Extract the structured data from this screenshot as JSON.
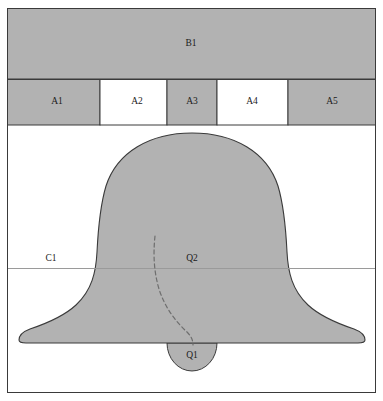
{
  "figure": {
    "title": "",
    "width": 383,
    "height": 401,
    "background_color": "#ffffff",
    "frame": {
      "x": 7,
      "y": 8,
      "width": 369,
      "height": 385,
      "stroke_color": "#3a3a3a",
      "fill_color": "#ffffff"
    },
    "colors": {
      "gray_fill": "#b2b2b2",
      "white_fill": "#ffffff",
      "outline": "#3a3a3a",
      "thin_rule": "#9a9a9a",
      "dashed_line": "#6e6e6e",
      "label_text": "#1a1a1a"
    }
  },
  "bands": {
    "top_band": {
      "label": "B1",
      "fill": "gray",
      "x": 7,
      "y": 8,
      "width": 369,
      "height": 71,
      "label_x": 191,
      "label_y": 44
    },
    "segment_row": {
      "y": 79,
      "height": 46,
      "cells": [
        {
          "label": "A1",
          "fill": "gray",
          "x": 7,
          "width": 93,
          "label_x": 57,
          "label_y": 102
        },
        {
          "label": "A2",
          "fill": "white",
          "x": 100,
          "width": 67,
          "label_x": 137,
          "label_y": 102
        },
        {
          "label": "A3",
          "fill": "gray",
          "x": 167,
          "width": 50,
          "label_x": 192,
          "label_y": 102
        },
        {
          "label": "A4",
          "fill": "white",
          "x": 217,
          "width": 71,
          "label_x": 252,
          "label_y": 102
        },
        {
          "label": "A5",
          "fill": "gray",
          "x": 288,
          "width": 88,
          "label_x": 332,
          "label_y": 102
        }
      ]
    }
  },
  "rules": [
    {
      "name": "horizontal-rule-c1",
      "y": 268,
      "x1": 7,
      "x2": 376,
      "color": "#9a9a9a"
    }
  ],
  "shapes": {
    "bell": {
      "name": "bell-body",
      "fill": "gray",
      "outline": "#3a3a3a",
      "top_y": 133,
      "base_y": 343,
      "left_base_x": 25,
      "right_base_x": 358,
      "waist_left_x": 97,
      "waist_right_x": 288,
      "center_x": 192
    },
    "clapper_dome": {
      "name": "clapper-dome",
      "label": "Q1",
      "fill": "gray",
      "center_x": 192,
      "top_y": 343,
      "radius_x": 25,
      "radius_y": 28,
      "label_x": 192,
      "label_y": 355
    },
    "clapper_line": {
      "name": "clapper-dashed-line",
      "dash": "4 3",
      "color": "#6e6e6e",
      "start": {
        "x": 155,
        "y": 236
      },
      "end": {
        "x": 193,
        "y": 345
      }
    }
  },
  "annotations": [
    {
      "name": "label-c1",
      "text": "C1",
      "x": 51,
      "y": 259
    },
    {
      "name": "label-q2",
      "text": "Q2",
      "x": 192,
      "y": 259
    }
  ]
}
